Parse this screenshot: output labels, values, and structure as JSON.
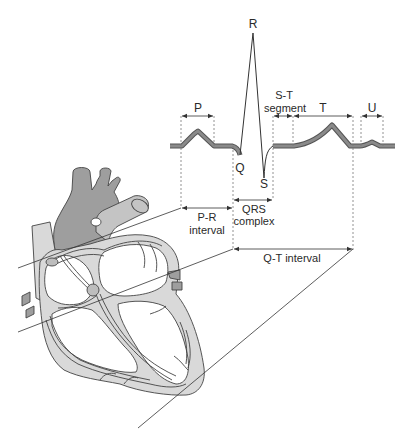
{
  "figure": {
    "waves": {
      "P": "P",
      "Q": "Q",
      "R": "R",
      "S": "S",
      "T": "T",
      "U": "U"
    },
    "segments": {
      "st_line1": "S-T",
      "st_line2": "segment",
      "pr_line1": "P-R",
      "pr_line2": "interval",
      "qrs_line1": "QRS",
      "qrs_line2": "complex",
      "qt": "Q-T interval"
    },
    "colors": {
      "background": "#ffffff",
      "ecg_trace": "#555555",
      "heart_wall": "#d9d9d9",
      "great_vessels": "#9e9e9e",
      "line": "#333333"
    }
  }
}
